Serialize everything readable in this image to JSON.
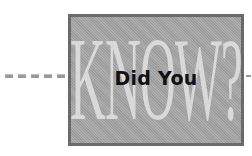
{
  "graphic": {
    "background_word": "KNOW?",
    "headline": "Did You",
    "dash_count": 5,
    "colors": {
      "box_fill": "#a6a6a6",
      "box_border": "#6a6a6a",
      "background_word": "#d9d9d9",
      "headline": "#111111",
      "dashes": "#9a9a9a"
    }
  }
}
